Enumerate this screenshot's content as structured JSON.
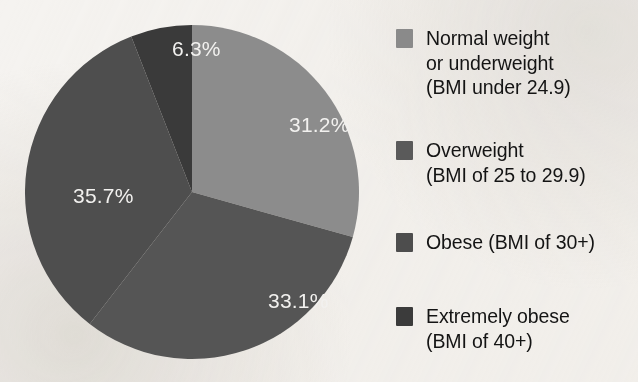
{
  "chart_data": {
    "type": "pie",
    "title": "",
    "subtitle": "",
    "xlabel": "",
    "ylabel": "",
    "legend_position": "right",
    "grid": false,
    "units": "percent",
    "start_angle_deg": 0,
    "direction": "clockwise",
    "categories": [
      "Normal weight or underweight (BMI under 24.9)",
      "Overweight (BMI of 25 to 29.9)",
      "Obese (BMI of 30+)",
      "Extremely obese (BMI of 40+)"
    ],
    "values": [
      31.2,
      33.1,
      35.7,
      6.3
    ],
    "labels": [
      "31.2%",
      "33.1%",
      "35.7%",
      "6.3%"
    ],
    "colors": [
      "#8c8c8c",
      "#555555",
      "#4e4e4e",
      "#3a3a3a"
    ],
    "slices": [
      {
        "name": "Normal weight or underweight (BMI under 24.9)",
        "value": 31.2,
        "label": "31.2%",
        "color": "#8c8c8c",
        "label_x": 264,
        "label_y": 114
      },
      {
        "name": "Overweight (BMI of 25 to 29.9)",
        "value": 33.1,
        "label": "33.1%",
        "color": "#555555",
        "label_x": 243,
        "label_y": 290
      },
      {
        "name": "Obese (BMI of 30+)",
        "value": 35.7,
        "label": "35.7%",
        "color": "#4e4e4e",
        "label_x": 48,
        "label_y": 185
      },
      {
        "name": "Extremely obese (BMI of 40+)",
        "value": 6.3,
        "label": "6.3%",
        "color": "#3a3a3a",
        "label_x": 147,
        "label_y": 38
      }
    ]
  },
  "legend": {
    "items": [
      {
        "label": "Normal weight\nor underweight\n(BMI under 24.9)",
        "color": "#8a8a8a"
      },
      {
        "label": "Overweight\n(BMI of 25 to 29.9)",
        "color": "#5a5a5a"
      },
      {
        "label": "Obese (BMI of 30+)",
        "color": "#4d4d4d"
      },
      {
        "label": "Extremely obese\n(BMI of 40+)",
        "color": "#3b3b3b"
      }
    ]
  }
}
